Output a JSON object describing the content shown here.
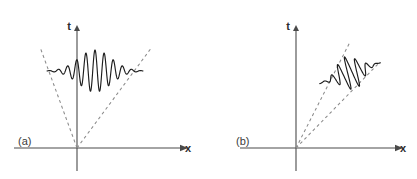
{
  "figure": {
    "background_color": "#ffffff",
    "width": 417,
    "height": 179,
    "axis_color": "#4a4a4a",
    "cone_color": "#8a8a8a",
    "wave_color": "#1c1c1c"
  },
  "panels": [
    {
      "id": "panel-a",
      "label": "(a)",
      "label_x": 18,
      "label_y": 145,
      "origin_x": 77,
      "origin_y": 148,
      "x_axis": {
        "label": "x",
        "start_x": 14,
        "end_x": 180,
        "y": 148,
        "label_x": 185,
        "label_y": 152
      },
      "t_axis": {
        "label": "t",
        "top_y": 30,
        "bottom_y": 171,
        "x": 77,
        "label_x": 71,
        "label_y": 30
      },
      "cones": [
        {
          "name": "left-light-cone",
          "x1": 77,
          "y1": 148,
          "x2": 40,
          "y2": 47
        },
        {
          "name": "right-light-cone",
          "x1": 77,
          "y1": 148,
          "x2": 152,
          "y2": 47
        }
      ],
      "wave": {
        "name": "wave-packet-spreading",
        "center_x": 95,
        "center_y": 71,
        "baseline_y": 71,
        "half_width": 48,
        "amplitude": 21,
        "cycles": 10.5,
        "envelope_sigma_ratio": 0.34,
        "tilt_deg": 0
      }
    },
    {
      "id": "panel-b",
      "label": "(b)",
      "label_x": 236,
      "label_y": 145,
      "origin_x": 296,
      "origin_y": 148,
      "x_axis": {
        "label": "x",
        "start_x": 240,
        "end_x": 395,
        "y": 148,
        "label_x": 400,
        "label_y": 152
      },
      "t_axis": {
        "label": "t",
        "top_y": 30,
        "bottom_y": 171,
        "x": 296,
        "label_x": 290,
        "label_y": 30
      },
      "cones": [
        {
          "name": "upper-light-cone",
          "x1": 296,
          "y1": 148,
          "x2": 350,
          "y2": 42
        },
        {
          "name": "lower-light-cone",
          "x1": 296,
          "y1": 148,
          "x2": 380,
          "y2": 62
        }
      ],
      "wave": {
        "name": "wave-packet-boosted",
        "center_x": 350,
        "center_y": 73,
        "baseline_y": 73,
        "half_width": 32,
        "amplitude": 17,
        "cycles": 7,
        "envelope_sigma_ratio": 0.34,
        "tilt_deg": -19
      }
    }
  ]
}
